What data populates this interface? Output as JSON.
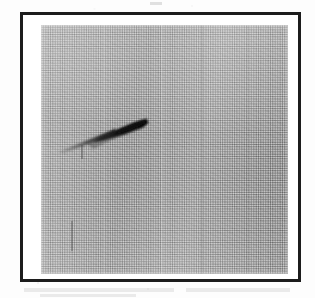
{
  "document": {
    "medium": "scanned halftone photographic print",
    "background_color": "#fdfdfd"
  },
  "frame": {
    "name": "photo-frame",
    "border_color": "#1c1c1c",
    "border_width_px": 3,
    "x": 20,
    "y": 12,
    "width": 281,
    "height": 270,
    "inner_mat_color": "#ffffff"
  },
  "photo": {
    "caption": "",
    "plate_color": "#a9a9a9",
    "x": 38,
    "y": 22,
    "width": 247,
    "height": 249,
    "texture": "halftone dot screen with scan grain",
    "tone": "uniform mid-gray sky"
  },
  "subject": {
    "name": "projectile",
    "description": "dark arrowhead-shaped object with a thin tapering smoke trail",
    "color": "#151515",
    "trail_color": "#3a3a3a",
    "position_x": 50,
    "position_y": 106,
    "heading": "up-right",
    "tip_x": 104,
    "tip_y": 112,
    "tail_x": 40,
    "tail_y": 138
  },
  "artifacts": {
    "vertical_streak_label": "print streak",
    "lower_left_mark_label": "faint vertical mark",
    "tick_label": "faint tick mark"
  }
}
